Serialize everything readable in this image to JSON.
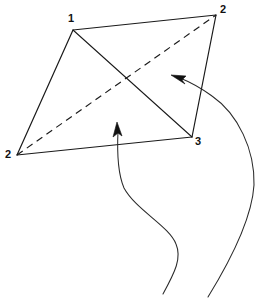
{
  "figure": {
    "background_color": "#ffffff",
    "stroke_color": "#1a1a1a",
    "label_color": "#111111",
    "stroke_width": 1.1,
    "canvas": {
      "width": 262,
      "height": 298
    },
    "vertices": [
      {
        "id": "v-top-left",
        "label": "1",
        "x": 73,
        "y": 30,
        "label_x": 68,
        "label_y": 13
      },
      {
        "id": "v-top-right",
        "label": "2",
        "x": 216,
        "y": 15,
        "label_x": 220,
        "label_y": 4
      },
      {
        "id": "v-bottom-right",
        "label": "3",
        "x": 192,
        "y": 137,
        "label_x": 195,
        "label_y": 136
      },
      {
        "id": "v-bottom-left",
        "label": "2",
        "x": 17,
        "y": 155,
        "label_x": 5,
        "label_y": 149
      }
    ],
    "edges": [
      {
        "id": "edge-1-2",
        "from": "v-top-left",
        "to": "v-top-right",
        "style": "solid"
      },
      {
        "id": "edge-2-3",
        "from": "v-top-right",
        "to": "v-bottom-right",
        "style": "solid"
      },
      {
        "id": "edge-3-2",
        "from": "v-bottom-right",
        "to": "v-bottom-left",
        "style": "solid"
      },
      {
        "id": "edge-2-1",
        "from": "v-bottom-left",
        "to": "v-top-left",
        "style": "solid"
      }
    ],
    "diagonals": [
      {
        "id": "diagonal-solid",
        "from": "v-top-left",
        "to": "v-bottom-right",
        "style": "solid"
      },
      {
        "id": "diagonal-dashed",
        "from": "v-bottom-left",
        "to": "v-top-right",
        "style": "dashed",
        "dash_pattern": "7 5"
      }
    ],
    "pointers": [
      {
        "id": "pointer-left",
        "description": "S-curve rising from bottom edge to arrowhead inside quadrilateral",
        "path": "M 163 294 C 175 272 182 258 176 244 C 169 226 136 210 124 188 C 118 174 117 152 118 131",
        "arrow_tip_x": 117,
        "arrow_tip_y": 123,
        "arrow_angle_deg": -82
      },
      {
        "id": "pointer-right",
        "description": "Long curve sweeping from bottom-right up and left to arrowhead near right edge",
        "path": "M 208 297 C 232 258 252 218 254 185 C 255 150 238 114 212 96 C 201 88 190 82 180 78",
        "arrow_tip_x": 172,
        "arrow_tip_y": 76,
        "arrow_angle_deg": 200
      }
    ]
  }
}
